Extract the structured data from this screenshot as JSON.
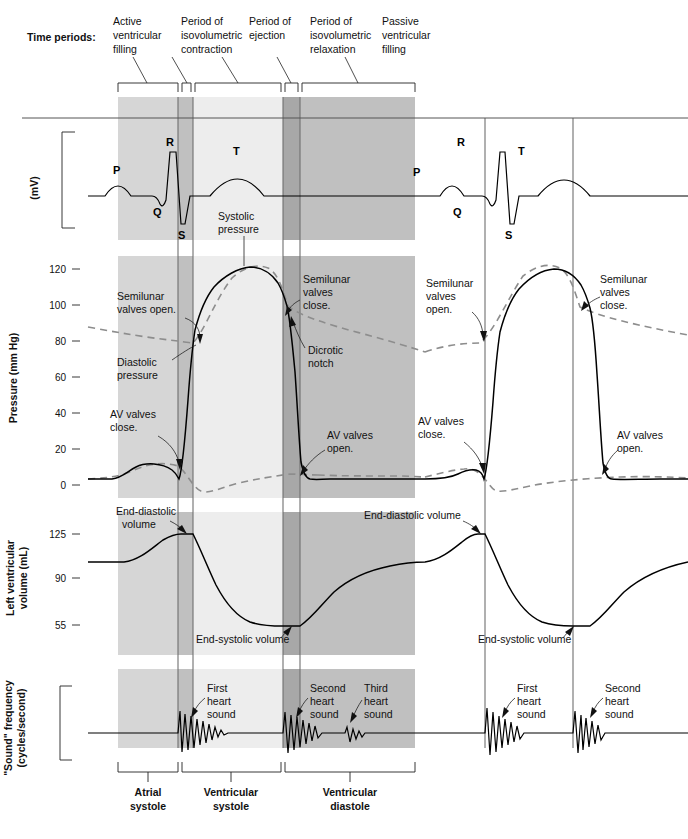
{
  "figure": {
    "time_periods_label": "Time periods:"
  },
  "colors": {
    "band_light": "#d6d6d6",
    "band_medium": "#c0c0c0",
    "band_pale": "#ededed",
    "band_dark": "#a8a8a8",
    "curve": "#000000",
    "dashed_curve": "#8d8d8d",
    "gridline": "#6f6f6f"
  },
  "time_periods": [
    {
      "id": "active-ventricular-filling",
      "label": "Active\nventricular\nfilling",
      "lines": [
        "Active",
        "ventricular",
        "filling"
      ]
    },
    {
      "id": "isovolumetric-contraction",
      "label": "Period of\nisovolumetric\ncontraction",
      "lines": [
        "Period of",
        "isovolumetric",
        "contraction"
      ]
    },
    {
      "id": "period-of-ejection",
      "label": "Period of\nejection",
      "lines": [
        "Period of",
        "ejection"
      ]
    },
    {
      "id": "isovolumetric-relaxation",
      "label": "Period of\nisovolumetric\nrelaxation",
      "lines": [
        "Period of",
        "isovolumetric",
        "relaxation"
      ]
    },
    {
      "id": "passive-ventricular-filling",
      "label": "Passive\nventricular\nfilling",
      "lines": [
        "Passive",
        "ventricular",
        "filling"
      ]
    }
  ],
  "panels": {
    "ecg": {
      "axis_label": "(mV)",
      "wave_labels": [
        "P",
        "Q",
        "R",
        "S",
        "T",
        "P",
        "Q",
        "R",
        "S",
        "T"
      ]
    },
    "pressure": {
      "axis_label": "Pressure (mm Hg)",
      "ticks": [
        "120",
        "100",
        "80",
        "60",
        "40",
        "20",
        "0"
      ],
      "annotations": [
        "Systolic\npressure",
        "Semilunar\nvalves open.",
        "Diastolic\npressure",
        "AV valves\nclose.",
        "Semilunar\nvalves\nclose.",
        "Dicrotic\nnotch",
        "AV valves\nopen.",
        "Semilunar\nvalves\nopen.",
        "AV valves\nclose.",
        "Semilunar\nvalves\nclose.",
        "AV valves\nopen."
      ]
    },
    "volume": {
      "axis_label": "Left ventricular\nvolume (mL)",
      "ticks": [
        "125",
        "90",
        "55"
      ],
      "annotations": [
        "End-diastolic\nvolume",
        "End-systolic volume",
        "End-diastolic volume",
        "End-systolic volume"
      ]
    },
    "sound": {
      "axis_label": "\"Sound\" frequency\n(cycles/second)",
      "annotations": [
        "First\nheart\nsound",
        "Second\nheart\nsound",
        "Third\nheart\nsound",
        "First\nheart\nsound",
        "Second\nheart\nsound"
      ]
    }
  },
  "phase_brackets": [
    {
      "id": "atrial-systole",
      "lines": [
        "Atrial",
        "systole"
      ]
    },
    {
      "id": "ventricular-systole",
      "lines": [
        "Ventricular",
        "systole"
      ]
    },
    {
      "id": "ventricular-diastole",
      "lines": [
        "Ventricular",
        "diastole"
      ]
    }
  ],
  "annotation_text": {
    "systolic_pressure": [
      "Systolic",
      "pressure"
    ],
    "semilunar_open_1": [
      "Semilunar",
      "valves open."
    ],
    "diastolic_pressure": [
      "Diastolic",
      "pressure"
    ],
    "av_close_1": [
      "AV valves",
      "close."
    ],
    "semilunar_close_1": [
      "Semilunar",
      "valves",
      "close."
    ],
    "dicrotic_notch": [
      "Dicrotic",
      "notch"
    ],
    "av_open_1": [
      "AV valves",
      "open."
    ],
    "semilunar_open_2": [
      "Semilunar",
      "valves",
      "open."
    ],
    "av_close_2": [
      "AV valves",
      "close."
    ],
    "semilunar_close_2": [
      "Semilunar",
      "valves",
      "close."
    ],
    "av_open_2": [
      "AV valves",
      "open."
    ],
    "edv_1": [
      "End-diastolic",
      "volume"
    ],
    "esv_1": [
      "End-systolic volume"
    ],
    "edv_2": [
      "End-diastolic volume"
    ],
    "esv_2": [
      "End-systolic volume"
    ],
    "s1_a": [
      "First",
      "heart",
      "sound"
    ],
    "s2_a": [
      "Second",
      "heart",
      "sound"
    ],
    "s3_a": [
      "Third",
      "heart",
      "sound"
    ],
    "s1_b": [
      "First",
      "heart",
      "sound"
    ],
    "s2_b": [
      "Second",
      "heart",
      "sound"
    ]
  },
  "chart_data": {
    "type": "line",
    "xlabel": "Time (cardiac cycles)",
    "grid": false,
    "legend": "none",
    "x_bands_px": [
      {
        "name": "active ventricular filling",
        "x0": 118,
        "x1": 178,
        "shade": "#d6d6d6"
      },
      {
        "name": "isovolumetric contraction",
        "x0": 178,
        "x1": 193,
        "shade": "#c0c0c0"
      },
      {
        "name": "period of ejection",
        "x0": 193,
        "x1": 283,
        "shade": "#ededed"
      },
      {
        "name": "isovolumetric relaxation",
        "x0": 283,
        "x1": 300,
        "shade": "#a8a8a8"
      },
      {
        "name": "passive ventricular filling",
        "x0": 300,
        "x1": 415,
        "shade": "#c0c0c0"
      }
    ],
    "event_lines_px": [
      178,
      193,
      283,
      300,
      485,
      573
    ],
    "panels": [
      {
        "name": "ECG",
        "ylabel": "(mV)",
        "series": [
          {
            "name": "ECG trace",
            "features": [
              "P",
              "Q",
              "R",
              "S",
              "T",
              "P",
              "Q",
              "R",
              "S",
              "T"
            ]
          }
        ]
      },
      {
        "name": "Pressure",
        "ylabel": "Pressure (mm Hg)",
        "yticks": [
          0,
          20,
          40,
          60,
          80,
          100,
          120
        ],
        "ylim": [
          0,
          128
        ],
        "series": [
          {
            "name": "Aortic pressure (dashed)",
            "style": "dashed",
            "systolic": 120,
            "diastolic": 80,
            "dicrotic_notch": 95
          },
          {
            "name": "Left ventricular pressure",
            "style": "solid",
            "peak": 122,
            "min": 5
          },
          {
            "name": "Left atrial pressure",
            "style": "dashed",
            "peak": 12,
            "min": 2
          }
        ]
      },
      {
        "name": "Left ventricular volume",
        "ylabel": "Left ventricular volume (mL)",
        "yticks": [
          55,
          90,
          125
        ],
        "ylim": [
          45,
          135
        ],
        "series": [
          {
            "name": "LV volume",
            "end_diastolic_volume": 125,
            "end_systolic_volume": 55,
            "stroke_volume": 70
          }
        ]
      },
      {
        "name": "Heart sounds",
        "ylabel": "\"Sound\" frequency (cycles/second)",
        "series": [
          {
            "name": "Phonocardiogram",
            "events": [
              "S1",
              "S2",
              "S3",
              "S1",
              "S2"
            ]
          }
        ]
      }
    ]
  }
}
